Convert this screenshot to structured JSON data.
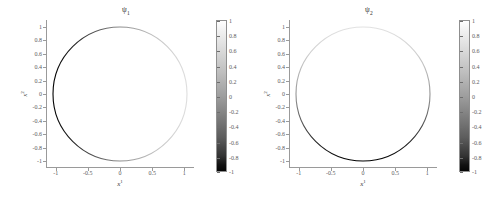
{
  "figure": {
    "background_color": "#ffffff",
    "axis_color": "#9a9a9a",
    "tick_text_color": "#5a5a5a"
  },
  "panels": [
    {
      "title": "ψ",
      "title_sub": "1",
      "xlabel": "x",
      "xlabel_sup": "1",
      "ylabel": "x",
      "ylabel_sup": "2",
      "xticks": [
        "-1",
        "-0.5",
        "0",
        "0.5",
        "1"
      ],
      "xtick_values": [
        -1,
        -0.5,
        0,
        0.5,
        1
      ],
      "yticks": [
        "1",
        "0.8",
        "0.6",
        "0.4",
        "0.2",
        "0",
        "-0.2",
        "-0.4",
        "-0.6",
        "-0.8",
        "-1"
      ],
      "ytick_values": [
        1,
        0.8,
        0.6,
        0.4,
        0.2,
        0,
        -0.2,
        -0.4,
        -0.6,
        -0.8,
        -1
      ],
      "colorbar_ticks": [
        "1",
        "0.8",
        "0.6",
        "0.4",
        "0.2",
        "0",
        "-0.2",
        "-0.4",
        "-0.6",
        "-0.8",
        "-1"
      ],
      "colorbar_tick_values": [
        1,
        0.8,
        0.6,
        0.4,
        0.2,
        0,
        -0.2,
        -0.4,
        -0.6,
        -0.8,
        -1
      ]
    },
    {
      "title": "ψ",
      "title_sub": "2",
      "xlabel": "x",
      "xlabel_sup": "1",
      "ylabel": "x",
      "ylabel_sup": "2",
      "xticks": [
        "-1",
        "-0.5",
        "0",
        "0.5",
        "1"
      ],
      "xtick_values": [
        -1,
        -0.5,
        0,
        0.5,
        1
      ],
      "yticks": [
        "1",
        "0.8",
        "0.6",
        "0.4",
        "0.2",
        "0",
        "-0.2",
        "-0.4",
        "-0.6",
        "-0.8",
        "-1"
      ],
      "ytick_values": [
        1,
        0.8,
        0.6,
        0.4,
        0.2,
        0,
        -0.2,
        -0.4,
        -0.6,
        -0.8,
        -1
      ],
      "colorbar_ticks": [
        "1",
        "0.8",
        "0.6",
        "0.4",
        "0.2",
        "0",
        "-0.2",
        "-0.4",
        "-0.6",
        "-0.8",
        "-1"
      ],
      "colorbar_tick_values": [
        1,
        0.8,
        0.6,
        0.4,
        0.2,
        0,
        -0.2,
        -0.4,
        -0.6,
        -0.8,
        -1
      ]
    }
  ],
  "chart_data": [
    {
      "type": "line",
      "title": "ψ₁",
      "xlabel": "x¹",
      "ylabel": "x²",
      "xlim": [
        -1.15,
        1.15
      ],
      "ylim": [
        -1.1,
        1.1
      ],
      "grid": false,
      "legend": null,
      "colormap": "gray",
      "colorbar": {
        "vmin": -1,
        "vmax": 1,
        "ticks": [
          -1,
          -0.8,
          -0.6,
          -0.4,
          -0.2,
          0,
          0.2,
          0.4,
          0.6,
          0.8,
          1
        ],
        "position": "right",
        "low_color": "#000000",
        "high_color": "#ffffff"
      },
      "description": "Unit circle x¹²+x²²=1 colored by the scalar field ψ₁ = x¹; black at the left (x¹=-1) fading to white at the right (x¹=+1).",
      "curve": "unit-circle",
      "color_field": "x1",
      "samples": [
        {
          "angle_deg": 0,
          "x": 1.0,
          "y": 0.0,
          "value": 1.0
        },
        {
          "angle_deg": 30,
          "x": 0.866,
          "y": 0.5,
          "value": 0.866
        },
        {
          "angle_deg": 60,
          "x": 0.5,
          "y": 0.866,
          "value": 0.5
        },
        {
          "angle_deg": 90,
          "x": 0.0,
          "y": 1.0,
          "value": 0.0
        },
        {
          "angle_deg": 120,
          "x": -0.5,
          "y": 0.866,
          "value": -0.5
        },
        {
          "angle_deg": 150,
          "x": -0.866,
          "y": 0.5,
          "value": -0.866
        },
        {
          "angle_deg": 180,
          "x": -1.0,
          "y": 0.0,
          "value": -1.0
        },
        {
          "angle_deg": 210,
          "x": -0.866,
          "y": -0.5,
          "value": -0.866
        },
        {
          "angle_deg": 240,
          "x": -0.5,
          "y": -0.866,
          "value": -0.5
        },
        {
          "angle_deg": 270,
          "x": 0.0,
          "y": -1.0,
          "value": 0.0
        },
        {
          "angle_deg": 300,
          "x": 0.5,
          "y": -0.866,
          "value": 0.5
        },
        {
          "angle_deg": 330,
          "x": 0.866,
          "y": -0.5,
          "value": 0.866
        }
      ]
    },
    {
      "type": "line",
      "title": "ψ₂",
      "xlabel": "x¹",
      "ylabel": "x²",
      "xlim": [
        -1.15,
        1.15
      ],
      "ylim": [
        -1.1,
        1.1
      ],
      "grid": false,
      "legend": null,
      "colormap": "gray",
      "colorbar": {
        "vmin": -1,
        "vmax": 1,
        "ticks": [
          -1,
          -0.8,
          -0.6,
          -0.4,
          -0.2,
          0,
          0.2,
          0.4,
          0.6,
          0.8,
          1
        ],
        "position": "right",
        "low_color": "#000000",
        "high_color": "#ffffff"
      },
      "description": "Unit circle x¹²+x²²=1 colored by the scalar field ψ₂ = x²; black at the bottom (x²=-1) fading to white at the top (x²=+1).",
      "curve": "unit-circle",
      "color_field": "x2",
      "samples": [
        {
          "angle_deg": 0,
          "x": 1.0,
          "y": 0.0,
          "value": 0.0
        },
        {
          "angle_deg": 30,
          "x": 0.866,
          "y": 0.5,
          "value": 0.5
        },
        {
          "angle_deg": 60,
          "x": 0.5,
          "y": 0.866,
          "value": 0.866
        },
        {
          "angle_deg": 90,
          "x": 0.0,
          "y": 1.0,
          "value": 1.0
        },
        {
          "angle_deg": 120,
          "x": -0.5,
          "y": 0.866,
          "value": 0.866
        },
        {
          "angle_deg": 150,
          "x": -0.866,
          "y": 0.5,
          "value": 0.5
        },
        {
          "angle_deg": 180,
          "x": -1.0,
          "y": 0.0,
          "value": 0.0
        },
        {
          "angle_deg": 210,
          "x": -0.866,
          "y": -0.5,
          "value": -0.5
        },
        {
          "angle_deg": 240,
          "x": -0.5,
          "y": -0.866,
          "value": -0.866
        },
        {
          "angle_deg": 270,
          "x": 0.0,
          "y": -1.0,
          "value": -1.0
        },
        {
          "angle_deg": 300,
          "x": 0.5,
          "y": -0.866,
          "value": -0.866
        },
        {
          "angle_deg": 330,
          "x": 0.866,
          "y": -0.5,
          "value": -0.5
        }
      ]
    }
  ]
}
